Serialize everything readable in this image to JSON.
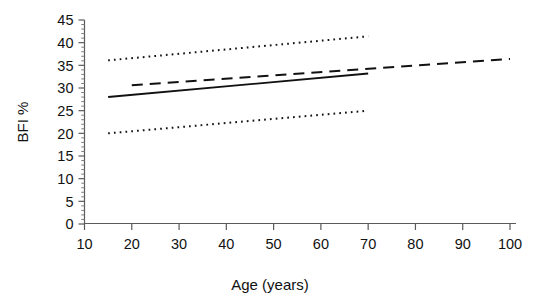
{
  "chart_data": {
    "type": "line",
    "title": "",
    "xlabel": "Age (years)",
    "ylabel": "BFI %",
    "xlim": [
      10,
      100
    ],
    "ylim": [
      0,
      45
    ],
    "xticks": [
      10,
      20,
      30,
      40,
      50,
      60,
      70,
      80,
      90,
      100
    ],
    "yticks": [
      0,
      5,
      10,
      15,
      20,
      25,
      30,
      35,
      40,
      45
    ],
    "y_minor_tick_step": 1,
    "grid": false,
    "legend": "none",
    "series": [
      {
        "name": "regression-line",
        "style": "solid",
        "color": "#111111",
        "x": [
          15,
          70
        ],
        "y": [
          28.0,
          33.2
        ]
      },
      {
        "name": "reference-line",
        "style": "dashed",
        "color": "#111111",
        "x": [
          20,
          100
        ],
        "y": [
          30.6,
          36.4
        ]
      },
      {
        "name": "upper-confidence-limit",
        "style": "dotted",
        "color": "#111111",
        "x": [
          15,
          70
        ],
        "y": [
          36.1,
          41.4
        ]
      },
      {
        "name": "lower-confidence-limit",
        "style": "dotted",
        "color": "#111111",
        "x": [
          15,
          70
        ],
        "y": [
          20.0,
          25.0
        ]
      }
    ]
  },
  "axes": {
    "x_title": "Age (years)",
    "y_title": "BFI %",
    "x_tick_labels": [
      "10",
      "20",
      "30",
      "40",
      "50",
      "60",
      "70",
      "80",
      "90",
      "100"
    ],
    "y_tick_labels": [
      "0",
      "5",
      "10",
      "15",
      "20",
      "25",
      "30",
      "35",
      "40",
      "45"
    ]
  },
  "colors": {
    "axis": "#444444",
    "text": "#111111",
    "line": "#111111",
    "background": "#ffffff"
  }
}
